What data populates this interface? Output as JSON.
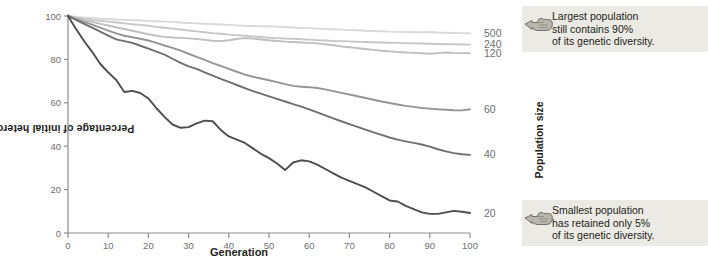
{
  "chart_data": {
    "type": "line",
    "title": "",
    "xlabel": "Generation",
    "ylabel": "Percentage of initial heterozygosity remaining",
    "xlim": [
      0,
      100
    ],
    "ylim": [
      0,
      100
    ],
    "xticks": [
      0,
      10,
      20,
      30,
      40,
      50,
      60,
      70,
      80,
      90,
      100
    ],
    "yticks": [
      0,
      20,
      40,
      60,
      80,
      100
    ],
    "grid": false,
    "legend_position": "right-axis-labels",
    "series_label_title": "Population size",
    "series": [
      {
        "name": "500",
        "color": "#d9d9d9",
        "end_label": "500",
        "x": [
          0,
          2,
          4,
          6,
          8,
          10,
          12,
          14,
          16,
          18,
          20,
          22,
          24,
          26,
          28,
          30,
          32,
          34,
          36,
          38,
          40,
          42,
          44,
          46,
          48,
          50,
          52,
          54,
          56,
          58,
          60,
          62,
          64,
          66,
          68,
          70,
          72,
          74,
          76,
          78,
          80,
          82,
          84,
          86,
          88,
          90,
          92,
          94,
          96,
          98,
          100
        ],
        "values": [
          100,
          99.6,
          99.3,
          99.1,
          98.8,
          98.6,
          98.4,
          98.3,
          98.1,
          97.9,
          97.7,
          97.6,
          97.4,
          97.3,
          97.0,
          96.8,
          96.6,
          96.4,
          96.3,
          96.1,
          95.9,
          95.7,
          95.5,
          95.4,
          95.2,
          95.3,
          95.1,
          94.9,
          94.7,
          94.5,
          94.4,
          94.2,
          94.0,
          93.9,
          93.7,
          93.5,
          93.4,
          93.2,
          93.1,
          93.0,
          92.8,
          92.7,
          92.6,
          92.5,
          92.5,
          92.6,
          92.4,
          92.3,
          92.2,
          92.1,
          92.0
        ]
      },
      {
        "name": "240",
        "color": "#c7c7c7",
        "end_label": "240",
        "x": [
          0,
          2,
          4,
          6,
          8,
          10,
          12,
          14,
          16,
          18,
          20,
          22,
          24,
          26,
          28,
          30,
          32,
          34,
          36,
          38,
          40,
          42,
          44,
          46,
          48,
          50,
          52,
          54,
          56,
          58,
          60,
          62,
          64,
          66,
          68,
          70,
          72,
          74,
          76,
          78,
          80,
          82,
          84,
          86,
          88,
          90,
          92,
          94,
          96,
          98,
          100
        ],
        "values": [
          100,
          99.3,
          98.7,
          98.2,
          97.8,
          97.4,
          97.0,
          96.6,
          96.2,
          95.9,
          95.5,
          95.0,
          94.6,
          94.2,
          93.8,
          93.3,
          92.9,
          92.5,
          92.1,
          91.8,
          91.4,
          91.2,
          90.9,
          90.6,
          90.3,
          90.0,
          89.8,
          89.6,
          89.5,
          89.3,
          89.1,
          88.9,
          88.7,
          88.5,
          88.4,
          88.3,
          88.1,
          88.0,
          87.9,
          87.8,
          87.7,
          87.6,
          87.5,
          87.4,
          87.3,
          87.2,
          87.1,
          87.0,
          87.0,
          86.9,
          86.8
        ]
      },
      {
        "name": "120",
        "color": "#bfbfbf",
        "end_label": "120",
        "x": [
          0,
          2,
          4,
          6,
          8,
          10,
          12,
          14,
          16,
          18,
          20,
          22,
          24,
          26,
          28,
          30,
          32,
          34,
          36,
          38,
          40,
          42,
          44,
          46,
          48,
          50,
          52,
          54,
          56,
          58,
          60,
          62,
          64,
          66,
          68,
          70,
          72,
          74,
          76,
          78,
          80,
          82,
          84,
          86,
          88,
          90,
          92,
          94,
          96,
          98,
          100
        ],
        "values": [
          100,
          99.0,
          98.1,
          97.3,
          96.4,
          95.6,
          94.8,
          94.0,
          93.2,
          92.4,
          91.6,
          90.9,
          90.4,
          90.1,
          89.9,
          89.7,
          89.4,
          89.0,
          88.6,
          88.4,
          88.8,
          89.4,
          89.8,
          89.6,
          89.2,
          88.8,
          88.5,
          88.2,
          88.0,
          87.8,
          87.6,
          87.4,
          87.0,
          86.5,
          86.0,
          85.6,
          85.2,
          84.8,
          84.4,
          84.0,
          83.7,
          83.4,
          83.2,
          83.0,
          82.8,
          82.6,
          82.9,
          83.2,
          83.0,
          82.9,
          82.8
        ]
      },
      {
        "name": "60",
        "color": "#959595",
        "end_label": "60",
        "x": [
          0,
          2,
          4,
          6,
          8,
          10,
          12,
          14,
          16,
          18,
          20,
          22,
          24,
          26,
          28,
          30,
          32,
          34,
          36,
          38,
          40,
          42,
          44,
          46,
          48,
          50,
          52,
          54,
          56,
          58,
          60,
          62,
          64,
          66,
          68,
          70,
          72,
          74,
          76,
          78,
          80,
          82,
          84,
          86,
          88,
          90,
          92,
          94,
          96,
          98,
          100
        ],
        "values": [
          100,
          98.6,
          97.3,
          96.0,
          94.6,
          93.3,
          92.0,
          90.9,
          90.2,
          89.5,
          88.7,
          87.6,
          86.4,
          85.3,
          84.0,
          82.6,
          81.2,
          79.8,
          78.3,
          77.0,
          75.6,
          74.3,
          73.0,
          72.0,
          71.2,
          70.4,
          69.5,
          68.6,
          67.8,
          67.4,
          67.2,
          66.8,
          66.2,
          65.4,
          64.6,
          63.8,
          63.0,
          62.2,
          61.4,
          60.6,
          59.9,
          59.2,
          58.6,
          58.1,
          57.6,
          57.3,
          57.0,
          56.8,
          56.6,
          56.5,
          57.0
        ]
      },
      {
        "name": "40",
        "color": "#6f6f6f",
        "end_label": "40",
        "x": [
          0,
          2,
          4,
          6,
          8,
          10,
          12,
          14,
          16,
          18,
          20,
          22,
          24,
          26,
          28,
          30,
          32,
          34,
          36,
          38,
          40,
          42,
          44,
          46,
          48,
          50,
          52,
          54,
          56,
          58,
          60,
          62,
          64,
          66,
          68,
          70,
          72,
          74,
          76,
          78,
          80,
          82,
          84,
          86,
          88,
          90,
          92,
          94,
          96,
          98,
          100
        ],
        "values": [
          100,
          98.2,
          96.4,
          94.6,
          92.8,
          91.0,
          89.2,
          88.4,
          87.6,
          86.3,
          85.0,
          83.6,
          82.2,
          80.3,
          78.4,
          76.8,
          75.6,
          74.0,
          72.5,
          71.0,
          69.6,
          68.2,
          66.8,
          65.4,
          64.2,
          63.0,
          61.8,
          60.6,
          59.4,
          58.2,
          57.0,
          55.6,
          54.2,
          52.8,
          51.5,
          50.2,
          48.9,
          47.6,
          46.4,
          45.2,
          44.0,
          43.0,
          42.2,
          41.5,
          40.8,
          39.8,
          38.6,
          37.6,
          36.8,
          36.3,
          36.0
        ]
      },
      {
        "name": "20",
        "color": "#4d4d4d",
        "end_label": "20",
        "x": [
          0,
          2,
          4,
          6,
          8,
          10,
          12,
          14,
          16,
          18,
          20,
          22,
          24,
          26,
          28,
          30,
          32,
          34,
          36,
          38,
          40,
          42,
          44,
          46,
          48,
          50,
          52,
          54,
          56,
          58,
          60,
          62,
          64,
          66,
          68,
          70,
          72,
          74,
          76,
          78,
          80,
          82,
          84,
          86,
          88,
          90,
          92,
          94,
          96,
          98,
          100
        ],
        "values": [
          100,
          94.0,
          88.5,
          83.5,
          78.0,
          74.0,
          70.5,
          65.0,
          65.5,
          64.5,
          62.0,
          57.5,
          53.5,
          50.0,
          48.5,
          48.8,
          50.5,
          51.8,
          51.5,
          47.5,
          44.5,
          43.0,
          41.5,
          39.0,
          36.5,
          34.5,
          32.0,
          29.0,
          32.5,
          33.5,
          33.0,
          31.5,
          29.5,
          27.5,
          25.5,
          24.0,
          22.5,
          21.0,
          19.0,
          17.0,
          15.0,
          14.5,
          12.5,
          11.0,
          9.5,
          8.8,
          8.8,
          9.5,
          10.2,
          9.8,
          9.2
        ]
      }
    ],
    "annotations": [
      {
        "id": "largest-population-callout",
        "icon": "pointing-hand-icon",
        "lines": [
          "Largest population",
          "still contains 90%",
          "of its genetic diversity."
        ],
        "points_to": "500"
      },
      {
        "id": "smallest-population-callout",
        "icon": "pointing-hand-icon",
        "lines": [
          "Smallest population",
          "has retained only 5%",
          "of its genetic diversity."
        ],
        "points_to": "20"
      }
    ]
  },
  "colors": {
    "axis": "#8d8d8d",
    "tick_text": "#6d6e71",
    "callout_bg": "#eceae4",
    "text": "#231f20"
  }
}
